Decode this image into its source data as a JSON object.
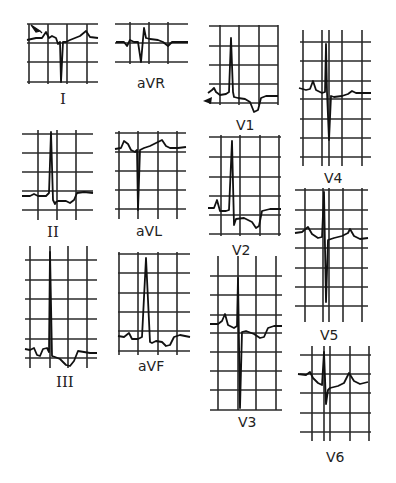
{
  "figure": {
    "leads": [
      {
        "id": "I",
        "label": "I"
      },
      {
        "id": "aVR",
        "label": "aVR"
      },
      {
        "id": "V1",
        "label": "V1"
      },
      {
        "id": "V4",
        "label": "V4"
      },
      {
        "id": "II",
        "label": "II"
      },
      {
        "id": "aVL",
        "label": "aVL"
      },
      {
        "id": "V2",
        "label": "V2"
      },
      {
        "id": "V5",
        "label": "V5"
      },
      {
        "id": "III",
        "label": "III"
      },
      {
        "id": "aVF",
        "label": "aVF"
      },
      {
        "id": "V3",
        "label": "V3"
      },
      {
        "id": "V6",
        "label": "V6"
      }
    ],
    "annotations": [
      {
        "lead": "I",
        "type": "arrow",
        "icon": "arrow-pointer-icon"
      },
      {
        "lead": "V1",
        "type": "arrow",
        "icon": "arrow-pointer-icon"
      }
    ]
  }
}
